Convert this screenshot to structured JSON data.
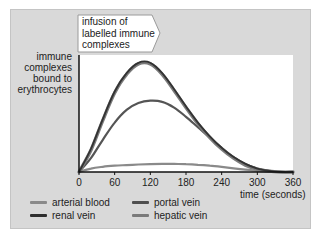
{
  "chart_data": {
    "type": "line",
    "title": "",
    "annotation": [
      "infusion of",
      "labelled immune",
      "complexes"
    ],
    "xlabel": "time (seconds)",
    "ylabel": [
      "immune",
      "complexes",
      "bound to",
      "erythrocytes"
    ],
    "xlim": [
      0,
      360
    ],
    "ylim": [
      0,
      100
    ],
    "x_ticks": [
      0,
      60,
      120,
      180,
      240,
      300,
      360
    ],
    "grid": false,
    "legend_position": "bottom",
    "x": [
      0,
      20,
      40,
      60,
      80,
      100,
      120,
      140,
      160,
      180,
      200,
      220,
      240,
      260,
      280,
      300,
      320,
      340,
      360
    ],
    "series": [
      {
        "name": "arterial blood",
        "color": "#8a8a8a",
        "values": [
          0,
          3,
          4.5,
          5.5,
          6,
          6.5,
          6.8,
          7,
          7,
          6.8,
          6.3,
          5.5,
          4.5,
          3.2,
          2,
          1,
          0.4,
          0,
          0
        ]
      },
      {
        "name": "renal vein",
        "color": "#333333",
        "values": [
          0,
          20,
          46,
          70,
          86,
          95,
          95,
          86,
          72,
          57,
          43,
          31,
          21,
          13,
          7,
          3,
          1,
          0,
          0
        ]
      },
      {
        "name": "portal vein",
        "color": "#555555",
        "values": [
          0,
          12,
          28,
          43,
          54,
          60,
          62,
          61,
          56,
          48,
          39,
          30,
          21,
          13,
          7,
          3,
          1,
          0,
          0
        ]
      },
      {
        "name": "hepatic vein",
        "color": "#7a7a7a",
        "values": [
          0,
          19,
          45,
          69,
          85,
          94,
          94,
          85,
          71,
          56,
          42,
          30,
          20,
          12,
          6,
          2.5,
          0.8,
          0,
          0
        ]
      }
    ]
  },
  "legend": {
    "items": [
      {
        "label": "arterial blood",
        "color": "#8a8a8a"
      },
      {
        "label": "portal vein",
        "color": "#4f4f4f"
      },
      {
        "label": "renal vein",
        "color": "#2e2e2e"
      },
      {
        "label": "hepatic vein",
        "color": "#7a7a7a"
      }
    ]
  },
  "axis": {
    "tick_labels": [
      "0",
      "60",
      "120",
      "180",
      "240",
      "300",
      "360"
    ],
    "xlabel": "time (seconds)",
    "ylabel_lines": [
      "immune",
      "complexes",
      "bound to",
      "erythrocytes"
    ]
  },
  "callout": {
    "lines": [
      "infusion of",
      "labelled immune",
      "complexes"
    ]
  }
}
